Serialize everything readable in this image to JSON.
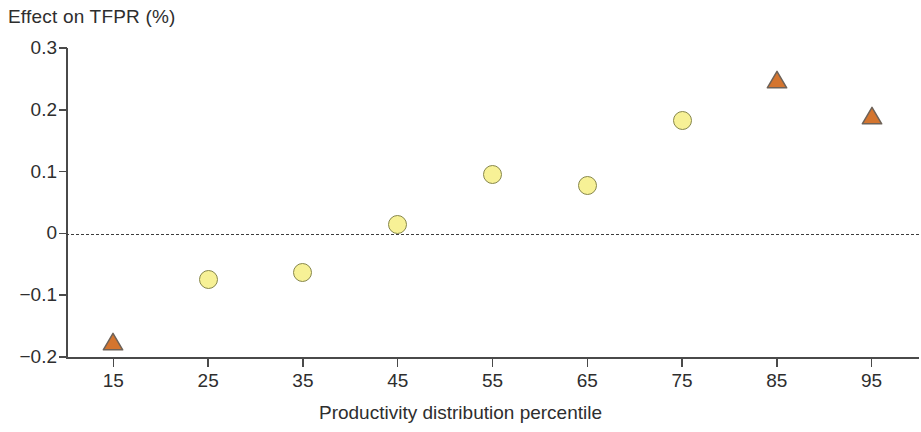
{
  "chart_data": {
    "type": "scatter",
    "title": "Effect on TFPR (%)",
    "xlabel": "Productivity distribution percentile",
    "ylabel": "Effect on TFPR (%)",
    "categories": [
      15,
      25,
      35,
      45,
      55,
      65,
      75,
      85,
      95
    ],
    "x": [
      15,
      25,
      35,
      45,
      55,
      65,
      75,
      85,
      95
    ],
    "values": [
      -0.175,
      -0.075,
      -0.063,
      0.015,
      0.095,
      0.078,
      0.183,
      0.248,
      0.19
    ],
    "marker_shapes": [
      "triangle",
      "circle",
      "circle",
      "circle",
      "circle",
      "circle",
      "circle",
      "triangle",
      "triangle"
    ],
    "points": [
      {
        "x": 15,
        "y": -0.175,
        "shape": "triangle"
      },
      {
        "x": 25,
        "y": -0.075,
        "shape": "circle"
      },
      {
        "x": 35,
        "y": -0.063,
        "shape": "circle"
      },
      {
        "x": 45,
        "y": 0.015,
        "shape": "circle"
      },
      {
        "x": 55,
        "y": 0.095,
        "shape": "circle"
      },
      {
        "x": 65,
        "y": 0.078,
        "shape": "circle"
      },
      {
        "x": 75,
        "y": 0.183,
        "shape": "circle"
      },
      {
        "x": 85,
        "y": 0.248,
        "shape": "triangle"
      },
      {
        "x": 95,
        "y": 0.19,
        "shape": "triangle"
      }
    ],
    "xlim": [
      10,
      100
    ],
    "ylim": [
      -0.2,
      0.3
    ],
    "ytick_labels": [
      "0.3",
      "0.2",
      "0.1",
      "0",
      "−0.1",
      "−0.2"
    ],
    "ytick_values": [
      0.3,
      0.2,
      0.1,
      0,
      -0.1,
      -0.2
    ],
    "xtick_labels": [
      "15",
      "25",
      "35",
      "45",
      "55",
      "65",
      "75",
      "85",
      "95"
    ],
    "grid": false,
    "legend": null,
    "annotations": [
      {
        "type": "reference-line",
        "value": 0,
        "style": "dashed",
        "orientation": "horizontal"
      }
    ],
    "colors": {
      "circle_fill": "#F7F196",
      "circle_stroke": "#87874A",
      "triangle_fill": "#D4752F",
      "triangle_stroke": "#6E6258",
      "axis": "#4A4A4A",
      "zero_line": "#3D3D3D",
      "text": "#2E2E2E",
      "background": "#FFFFFF"
    }
  }
}
